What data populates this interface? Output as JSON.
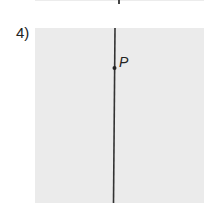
{
  "problem": {
    "number_label": "4)",
    "point_label": "P"
  }
}
